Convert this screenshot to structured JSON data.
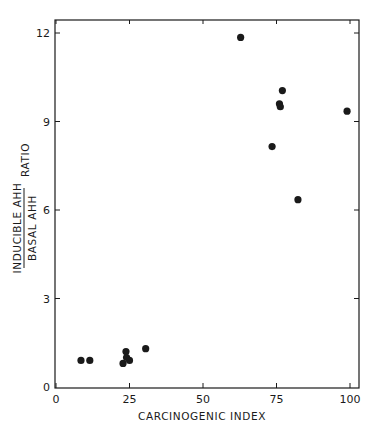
{
  "chart_data": {
    "type": "scatter",
    "title": "",
    "xlabel": "CARCINOGENIC INDEX",
    "ylabel": {
      "numerator": "INDUCIBLE AHH",
      "denominator": "BASAL AHH",
      "suffix": "RATIO"
    },
    "xlim": [
      0,
      103
    ],
    "ylim": [
      0,
      12.5
    ],
    "x_ticks": [
      0,
      25,
      50,
      75,
      100
    ],
    "x_tick_labels": [
      "0",
      "25",
      "50",
      "75",
      "100"
    ],
    "y_ticks": [
      0,
      3,
      6,
      9,
      12
    ],
    "y_tick_labels": [
      "0",
      "3",
      "6",
      "9",
      "12"
    ],
    "grid": false,
    "legend": null,
    "series": [
      {
        "name": "compounds",
        "points": [
          {
            "x": 8.5,
            "y": 0.9
          },
          {
            "x": 11.5,
            "y": 0.9
          },
          {
            "x": 22.8,
            "y": 0.8
          },
          {
            "x": 23.8,
            "y": 1.2
          },
          {
            "x": 24.0,
            "y": 1.0
          },
          {
            "x": 25.0,
            "y": 0.9
          },
          {
            "x": 30.5,
            "y": 1.3
          },
          {
            "x": 62.8,
            "y": 11.85
          },
          {
            "x": 73.5,
            "y": 8.15
          },
          {
            "x": 76.0,
            "y": 9.6
          },
          {
            "x": 76.3,
            "y": 9.5
          },
          {
            "x": 77.0,
            "y": 10.05
          },
          {
            "x": 82.3,
            "y": 6.35
          },
          {
            "x": 99.0,
            "y": 9.35
          }
        ]
      }
    ]
  },
  "colors": {
    "ink": "#1a1a1a",
    "background": "#ffffff"
  }
}
